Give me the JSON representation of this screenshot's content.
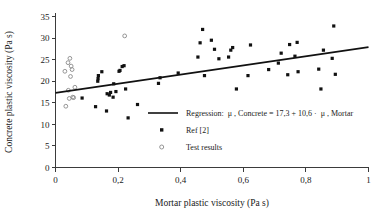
{
  "chart_data": {
    "type": "scatter",
    "title": "",
    "xlabel": "Mortar plastic viscosity (Pa s)",
    "ylabel": "Concrete plastic viscosity (Pa s)",
    "xlim": [
      0,
      1
    ],
    "ylim": [
      0,
      35
    ],
    "xticks": [
      "0",
      "0,2",
      "0,4",
      "0,6",
      "0,8",
      "1"
    ],
    "xtick_values": [
      0,
      0.2,
      0.4,
      0.6,
      0.8,
      1
    ],
    "yticks": [
      "0",
      "5",
      "10",
      "15",
      "20",
      "25",
      "30",
      "35"
    ],
    "ytick_values": [
      0,
      5,
      10,
      15,
      20,
      25,
      30,
      35
    ],
    "grid": false,
    "legend_position": "inside-center-lower",
    "decimal_separator": "comma",
    "series": [
      {
        "name": "Regression",
        "type": "line",
        "label": "Regression:  μ , Concrete = 17,3 + 10,6 ·  μ , Mortar",
        "equation": {
          "dependent": "μ , Concrete",
          "intercept": "17,3",
          "slope": "10,6",
          "independent": "μ , Mortar",
          "text": "Regression:  μ , Concrete = 17,3 + 10,6 ·  μ , Mortar"
        },
        "intercept": 17.3,
        "slope": 10.6,
        "color": "#111111",
        "x_from": 0,
        "x_to": 1
      },
      {
        "name": "Ref [2]",
        "type": "scatter",
        "marker": "filled-square",
        "color": "#111111",
        "points": [
          [
            0.085,
            16.1
          ],
          [
            0.128,
            14.1
          ],
          [
            0.135,
            20.0
          ],
          [
            0.136,
            20.6
          ],
          [
            0.137,
            21.3
          ],
          [
            0.148,
            22.2
          ],
          [
            0.163,
            13.1
          ],
          [
            0.165,
            17.1
          ],
          [
            0.172,
            16.8
          ],
          [
            0.176,
            17.4
          ],
          [
            0.184,
            16.3
          ],
          [
            0.186,
            19.4
          ],
          [
            0.193,
            17.6
          ],
          [
            0.203,
            22.3
          ],
          [
            0.206,
            22.5
          ],
          [
            0.213,
            23.4
          ],
          [
            0.219,
            23.6
          ],
          [
            0.224,
            18.2
          ],
          [
            0.232,
            11.5
          ],
          [
            0.262,
            14.6
          ],
          [
            0.329,
            19.5
          ],
          [
            0.334,
            20.8
          ],
          [
            0.392,
            21.9
          ],
          [
            0.455,
            25.6
          ],
          [
            0.462,
            28.9
          ],
          [
            0.47,
            32.0
          ],
          [
            0.476,
            21.3
          ],
          [
            0.498,
            29.5
          ],
          [
            0.508,
            27.4
          ],
          [
            0.522,
            25.2
          ],
          [
            0.553,
            25.6
          ],
          [
            0.56,
            27.2
          ],
          [
            0.566,
            27.8
          ],
          [
            0.578,
            18.2
          ],
          [
            0.615,
            21.3
          ],
          [
            0.623,
            28.4
          ],
          [
            0.681,
            22.7
          ],
          [
            0.712,
            24.2
          ],
          [
            0.721,
            26.5
          ],
          [
            0.742,
            21.5
          ],
          [
            0.748,
            28.5
          ],
          [
            0.765,
            25.8
          ],
          [
            0.772,
            29.0
          ],
          [
            0.775,
            22.2
          ],
          [
            0.841,
            22.8
          ],
          [
            0.848,
            18.2
          ],
          [
            0.856,
            27.2
          ],
          [
            0.884,
            25.3
          ],
          [
            0.889,
            32.8
          ],
          [
            0.894,
            21.6
          ]
        ]
      },
      {
        "name": "Test results",
        "type": "scatter",
        "marker": "open-circle",
        "color": "#8a8a8a",
        "points": [
          [
            0.03,
            22.3
          ],
          [
            0.033,
            14.2
          ],
          [
            0.04,
            24.3
          ],
          [
            0.041,
            17.9
          ],
          [
            0.044,
            16.0
          ],
          [
            0.046,
            25.3
          ],
          [
            0.048,
            21.1
          ],
          [
            0.05,
            23.5
          ],
          [
            0.053,
            22.7
          ],
          [
            0.055,
            16.3
          ],
          [
            0.058,
            16.2
          ],
          [
            0.062,
            18.6
          ],
          [
            0.221,
            30.5
          ]
        ]
      }
    ],
    "legend_items": [
      {
        "marker": "line",
        "label": "Regression:  μ , Concrete = 17,3 + 10,6 ·  μ , Mortar"
      },
      {
        "marker": "filled-square",
        "label": "Ref [2]"
      },
      {
        "marker": "open-circle",
        "label": "Test results"
      }
    ]
  }
}
